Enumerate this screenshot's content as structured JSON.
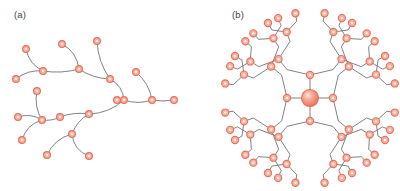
{
  "figure": {
    "type": "diagram",
    "background_color": "#ffffff",
    "node_fill_color": "#f6b3a4",
    "node_stroke_color": "#e8705c",
    "edge_color": "#6b6b6b",
    "label_color": "#3f3f3f"
  },
  "panels": [
    {
      "id": "a",
      "label": "(a)",
      "kind": "irregular-tree",
      "node_count": 26,
      "node_radius": 3.4,
      "nodes": [
        {
          "id": 0,
          "x": 26,
          "y": 49
        },
        {
          "id": 1,
          "x": 16,
          "y": 79
        },
        {
          "id": 2,
          "x": 43,
          "y": 71
        },
        {
          "id": 3,
          "x": 62,
          "y": 44
        },
        {
          "id": 4,
          "x": 79,
          "y": 69
        },
        {
          "id": 5,
          "x": 97,
          "y": 41
        },
        {
          "id": 6,
          "x": 110,
          "y": 79
        },
        {
          "id": 7,
          "x": 124,
          "y": 100
        },
        {
          "id": 8,
          "x": 136,
          "y": 72
        },
        {
          "id": 9,
          "x": 152,
          "y": 100
        },
        {
          "id": 10,
          "x": 174,
          "y": 100
        },
        {
          "id": 11,
          "x": 37,
          "y": 91
        },
        {
          "id": 12,
          "x": 18,
          "y": 117
        },
        {
          "id": 13,
          "x": 42,
          "y": 120
        },
        {
          "id": 14,
          "x": 60,
          "y": 117
        },
        {
          "id": 15,
          "x": 89,
          "y": 114
        },
        {
          "id": 16,
          "x": 22,
          "y": 140
        },
        {
          "id": 17,
          "x": 47,
          "y": 155
        },
        {
          "id": 18,
          "x": 72,
          "y": 134
        },
        {
          "id": 19,
          "x": 89,
          "y": 156
        },
        {
          "id": 20,
          "x": 117,
          "y": 100
        }
      ],
      "edges": [
        {
          "from": 0,
          "to": 2
        },
        {
          "from": 1,
          "to": 2
        },
        {
          "from": 2,
          "to": 4
        },
        {
          "from": 3,
          "to": 4
        },
        {
          "from": 4,
          "to": 6
        },
        {
          "from": 5,
          "to": 6
        },
        {
          "from": 6,
          "to": 7
        },
        {
          "from": 7,
          "to": 9
        },
        {
          "from": 8,
          "to": 9
        },
        {
          "from": 9,
          "to": 10
        },
        {
          "from": 11,
          "to": 13
        },
        {
          "from": 12,
          "to": 13
        },
        {
          "from": 13,
          "to": 14
        },
        {
          "from": 13,
          "to": 16
        },
        {
          "from": 14,
          "to": 15
        },
        {
          "from": 15,
          "to": 7
        },
        {
          "from": 17,
          "to": 18
        },
        {
          "from": 18,
          "to": 19
        },
        {
          "from": 18,
          "to": 15
        }
      ]
    },
    {
      "id": "b",
      "label": "(b)",
      "kind": "radial-dendrimer",
      "center": {
        "x": 310,
        "y": 98
      },
      "core_radius": 8.5,
      "node_radius": 3.6,
      "generations": 4,
      "primary_branches": 4,
      "branching_factor": 2,
      "terminal_node_count": 32,
      "total_node_count": 61,
      "generation_radii": [
        23,
        50,
        70,
        86
      ],
      "primary_branch_angles_deg": [
        0,
        90,
        180,
        270
      ]
    }
  ]
}
